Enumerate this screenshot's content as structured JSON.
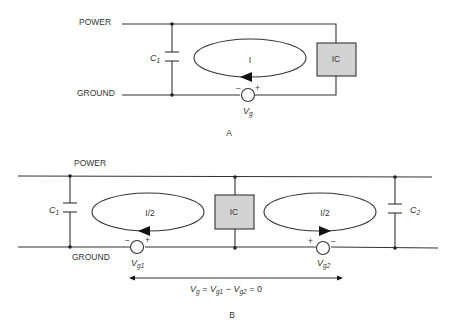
{
  "diagram_a": {
    "caption": "A",
    "power_label": "POWER",
    "ground_label": "GROUND",
    "capacitor": {
      "name": "C",
      "sub": "1"
    },
    "ic_label": "IC",
    "loop_label": "I",
    "source": {
      "name": "V",
      "sub": "g",
      "minus": "−",
      "plus": "+"
    }
  },
  "diagram_b": {
    "caption": "B",
    "power_label": "POWER",
    "ground_label": "GROUND",
    "capacitor_left": {
      "name": "C",
      "sub": "1"
    },
    "capacitor_right": {
      "name": "C",
      "sub": "2"
    },
    "ic_label": "IC",
    "loop_left_label": "I/2",
    "loop_right_label": "I/2",
    "source_left": {
      "name": "V",
      "sub": "g1",
      "minus": "−",
      "plus": "+"
    },
    "source_right": {
      "name": "V",
      "sub": "g2",
      "minus": "−",
      "plus": "+"
    },
    "equation": {
      "v": "V",
      "g": "g",
      "eq1": " = ",
      "v1": "V",
      "g1": "g1",
      "minus": " − ",
      "v2": "V",
      "g2": "g2",
      "eq2": " = 0"
    }
  },
  "colors": {
    "line": "#333333",
    "ic_fill": "#d3d3d3",
    "background": "#ffffff"
  }
}
